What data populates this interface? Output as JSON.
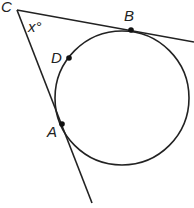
{
  "figure": {
    "type": "geometry",
    "labels": {
      "C": "C",
      "B": "B",
      "D": "D",
      "A": "A",
      "angle": "x°"
    },
    "stroke_color": "#222222"
  }
}
